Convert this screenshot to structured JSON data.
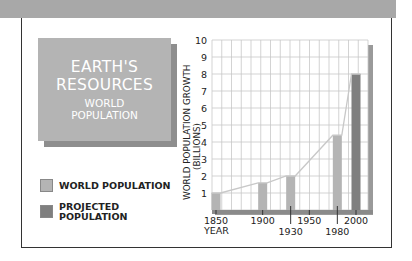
{
  "title_box": {
    "line1": "EARTH'S",
    "line2": "RESOURCES",
    "line3": "WORLD",
    "line4": "POPULATION"
  },
  "legend": [
    {
      "label": "WORLD POPULATION",
      "color": "#b4b4b4"
    },
    {
      "label_line1": "PROJECTED",
      "label_line2": "POPULATION",
      "color": "#7f7f7f"
    }
  ],
  "colors": {
    "banner": "#a8a8a8",
    "title_bg": "#b4b4b4",
    "bar_actual": "#b4b4b4",
    "bar_projected": "#7f7f7f",
    "line": "#c8c8c8",
    "grid": "#c8c8c8"
  },
  "chart_data": {
    "type": "bar",
    "xlabel": "YEAR",
    "ylabel": "WORLD POPULATION GROWTH (BILLIONS)",
    "ylabel_line1": "WORLD POPULATION GROWTH",
    "ylabel_line2": "(BILLIONS)",
    "ylim": [
      0,
      10
    ],
    "y_ticks": [
      "1",
      "2",
      "3",
      "4",
      "5",
      "6",
      "7",
      "8",
      "9",
      "10"
    ],
    "x_tick_labels_upper": [
      "1850",
      "1900",
      "1950",
      "2000"
    ],
    "x_tick_labels_lower": [
      "YEAR",
      "1930",
      "1980"
    ],
    "grid": true,
    "legend_position": "left",
    "categories": [
      "1850",
      "1900",
      "1930",
      "1980",
      "2000"
    ],
    "series": [
      {
        "name": "WORLD POPULATION",
        "values": [
          1.0,
          1.6,
          2.0,
          4.4,
          null
        ]
      },
      {
        "name": "PROJECTED POPULATION",
        "values": [
          null,
          null,
          null,
          null,
          8.0
        ]
      }
    ],
    "trend_line": {
      "x": [
        "1850",
        "1900",
        "1930",
        "1980",
        "2000"
      ],
      "y": [
        1.0,
        1.6,
        2.0,
        4.4,
        8.0
      ]
    }
  }
}
